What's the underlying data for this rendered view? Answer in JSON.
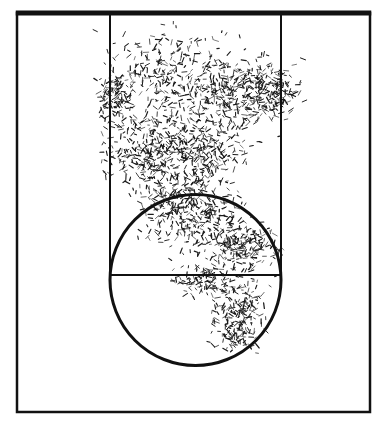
{
  "figure": {
    "background_color": "#ffffff",
    "line_color": "#111111",
    "mark_color": "#1a1a1a",
    "width": 386,
    "height": 425
  },
  "court": {
    "name": "half-court-diagram",
    "boundary": {
      "label": "Court boundary",
      "x": 17,
      "y": 13,
      "width": 353,
      "height": 399,
      "stroke_width_top": 5,
      "stroke_width_sides": 2.5
    },
    "key": {
      "label": "Lane / Paint (key)",
      "x": 110,
      "y": 13,
      "width": 171,
      "height": 262,
      "stroke_width": 2
    },
    "free_throw_line": {
      "label": "Free throw line",
      "x1": 110,
      "x2": 281,
      "y": 275,
      "stroke_width": 2
    },
    "free_throw_circle": {
      "label": "Free throw circle",
      "cx": 195.5,
      "cy": 280,
      "r": 85.5,
      "stroke_width": 3
    },
    "baseline": {
      "label": "Baseline",
      "y": 13
    }
  },
  "chart_data": {
    "type": "scatter",
    "xlabel": "",
    "ylabel": "",
    "xlim": [
      17,
      370
    ],
    "ylim": [
      13,
      412
    ],
    "grid": false,
    "legend": null,
    "marker": "short-stroke",
    "point_count": 2400,
    "clusters": [
      {
        "name": "upper-lane-core",
        "cx": 170,
        "cy": 75,
        "rx": 62,
        "ry": 45,
        "density": 1.0
      },
      {
        "name": "upper-right-lane",
        "cx": 236,
        "cy": 95,
        "rx": 42,
        "ry": 38,
        "density": 0.92
      },
      {
        "name": "mid-lane-left",
        "cx": 145,
        "cy": 150,
        "rx": 40,
        "ry": 40,
        "density": 0.88
      },
      {
        "name": "mid-lane-center",
        "cx": 200,
        "cy": 150,
        "rx": 48,
        "ry": 38,
        "density": 0.95
      },
      {
        "name": "right-wing-spur",
        "cx": 272,
        "cy": 90,
        "rx": 26,
        "ry": 30,
        "density": 0.45
      },
      {
        "name": "left-edge-spur",
        "cx": 116,
        "cy": 95,
        "rx": 16,
        "ry": 26,
        "density": 0.38
      },
      {
        "name": "lane-bottom",
        "cx": 185,
        "cy": 200,
        "rx": 48,
        "ry": 30,
        "density": 0.8
      },
      {
        "name": "circle-top",
        "cx": 200,
        "cy": 228,
        "rx": 50,
        "ry": 26,
        "density": 0.6
      },
      {
        "name": "circle-right",
        "cx": 245,
        "cy": 248,
        "rx": 30,
        "ry": 26,
        "density": 0.62
      },
      {
        "name": "ft-line-center",
        "cx": 205,
        "cy": 280,
        "rx": 30,
        "ry": 16,
        "density": 0.34
      },
      {
        "name": "lower-circle-right",
        "cx": 240,
        "cy": 305,
        "rx": 26,
        "ry": 24,
        "density": 0.5
      },
      {
        "name": "lower-circle-tail",
        "cx": 235,
        "cy": 335,
        "rx": 22,
        "ry": 18,
        "density": 0.3
      }
    ]
  }
}
